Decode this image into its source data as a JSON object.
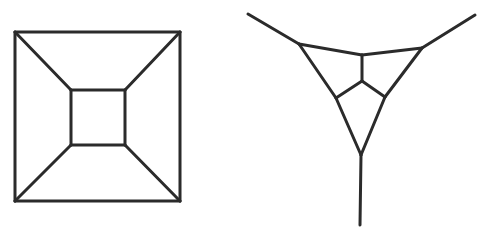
{
  "style": {
    "stroke": "#2b2b2b",
    "stroke_width": 3,
    "background": "#ffffff"
  },
  "figures": [
    {
      "name": "cube-graph-square",
      "lines": [
        [
          15,
          32,
          180,
          32
        ],
        [
          180,
          32,
          180,
          201
        ],
        [
          180,
          201,
          15,
          201
        ],
        [
          15,
          201,
          15,
          32
        ],
        [
          71,
          90,
          125,
          90
        ],
        [
          125,
          90,
          125,
          145
        ],
        [
          125,
          145,
          71,
          145
        ],
        [
          71,
          145,
          71,
          90
        ],
        [
          15,
          32,
          71,
          90
        ],
        [
          180,
          32,
          125,
          90
        ],
        [
          180,
          201,
          125,
          145
        ],
        [
          15,
          201,
          71,
          145
        ]
      ]
    },
    {
      "name": "triangle-graph-with-y",
      "lines": [
        [
          248,
          14,
          299,
          44
        ],
        [
          475,
          15,
          422,
          48
        ],
        [
          361,
          155,
          360,
          225
        ],
        [
          299,
          44,
          362,
          55
        ],
        [
          362,
          55,
          422,
          48
        ],
        [
          299,
          44,
          336,
          98
        ],
        [
          336,
          98,
          361,
          155
        ],
        [
          422,
          48,
          385,
          97
        ],
        [
          385,
          97,
          361,
          155
        ],
        [
          362,
          55,
          362,
          81
        ],
        [
          362,
          81,
          336,
          98
        ],
        [
          362,
          81,
          385,
          97
        ]
      ]
    }
  ]
}
